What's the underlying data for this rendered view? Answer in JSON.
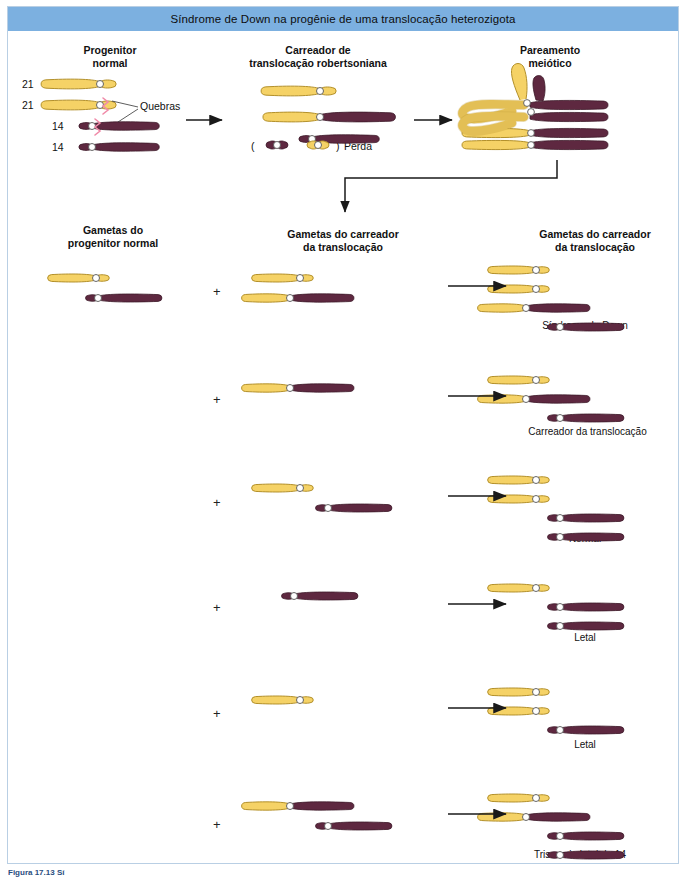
{
  "figure": {
    "title": "Síndrome de Down na progênie de uma translocação heterozigota",
    "caption": "Figura 17.13 Sí",
    "title_bar_color": "#7cb0e0",
    "frame_color": "#b9cfe4"
  },
  "colors": {
    "chr21_fill": "#f5d266",
    "chr21_stroke": "#b3902a",
    "chr14_fill": "#5e2840",
    "chr14_stroke": "#3d1a2a",
    "centromere_fill": "#ffffff",
    "centromere_stroke": "#555555",
    "break_mark": "#f08aa8",
    "arrow": "#1a1a1a"
  },
  "top_panels": [
    {
      "id": "progenitor",
      "heading": "Progenitor\nnormal"
    },
    {
      "id": "carrier",
      "heading": "Carreador de\ntranslocação robertsoniana"
    },
    {
      "id": "pairing",
      "heading": "Pareamento\nmeiótico"
    }
  ],
  "progenitor_panel": {
    "chromosome_labels": [
      "21",
      "21",
      "14",
      "14"
    ],
    "annotation": "Quebras"
  },
  "carrier_panel": {
    "loss_label": "Perda",
    "loss_open_paren": "(",
    "loss_close_paren": ")"
  },
  "gamete_headings": [
    "Gametas do\nprogenitor normal",
    "Gametas do carreador\nda translocação",
    "Gametas do carreador\nda translocação"
  ],
  "crosses": [
    {
      "row": 1,
      "plus": "+",
      "outcome": "Síndrome de Down"
    },
    {
      "row": 2,
      "plus": "+",
      "outcome": "Carreador da translocação"
    },
    {
      "row": 3,
      "plus": "+",
      "outcome": "Normal"
    },
    {
      "row": 4,
      "plus": "+",
      "outcome": "Letal"
    },
    {
      "row": 5,
      "plus": "+",
      "outcome": "Letal"
    },
    {
      "row": 6,
      "plus": "+",
      "outcome": "Trissomia letal do 14"
    }
  ]
}
